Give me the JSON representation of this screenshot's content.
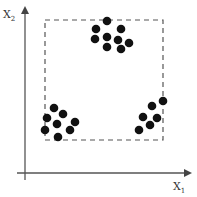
{
  "diagram": {
    "type": "scatter-clusters",
    "axes": {
      "x_label": "X",
      "x_subscript": "1",
      "y_label": "X",
      "y_subscript": "2"
    },
    "bounding_box": {
      "style": "dashed",
      "x0": 45,
      "y0": 20,
      "x1": 163,
      "y1": 140
    },
    "clusters": [
      {
        "name": "top-cluster",
        "points": [
          [
            107,
            21
          ],
          [
            96,
            29
          ],
          [
            121,
            29
          ],
          [
            95,
            39
          ],
          [
            107,
            37
          ],
          [
            118,
            40
          ],
          [
            129,
            43
          ],
          [
            107,
            47
          ],
          [
            121,
            49
          ]
        ]
      },
      {
        "name": "bottom-left-cluster",
        "points": [
          [
            54,
            108
          ],
          [
            47,
            118
          ],
          [
            63,
            114
          ],
          [
            57,
            124
          ],
          [
            75,
            122
          ],
          [
            45,
            130
          ],
          [
            70,
            130
          ],
          [
            58,
            137
          ]
        ]
      },
      {
        "name": "bottom-right-cluster",
        "points": [
          [
            163,
            101
          ],
          [
            152,
            106
          ],
          [
            143,
            117
          ],
          [
            157,
            118
          ],
          [
            150,
            125
          ],
          [
            139,
            130
          ]
        ]
      }
    ],
    "colors": {
      "axis": "#555555",
      "dots": "#111111",
      "box": "#555555"
    }
  }
}
